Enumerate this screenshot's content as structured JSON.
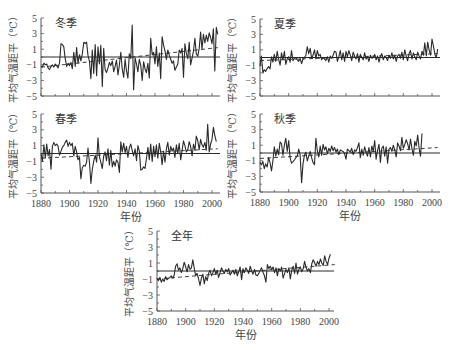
{
  "figure": {
    "ylabel": "平均气温距平（℃）",
    "xlabel": "年份"
  },
  "chart_data": [
    {
      "type": "line",
      "title": "冬季",
      "xlabel": "",
      "ylabel": "平均气温距平（℃）",
      "xlim": [
        1880,
        2005
      ],
      "ylim": [
        -5,
        5
      ],
      "yticks": [
        5,
        3,
        1,
        -1,
        -3,
        -5
      ],
      "xticks": [],
      "grid": false,
      "baseline": 0,
      "trend": {
        "x": [
          1880,
          2004
        ],
        "y": [
          -1.3,
          1.2
        ],
        "style": "dashed"
      },
      "series": [
        {
          "name": "冬季",
          "x_start": 1880,
          "values": [
            -1.2,
            -1.3,
            -0.8,
            -1.0,
            -0.9,
            -1.4,
            -1.6,
            -1.2,
            -1.0,
            -1.3,
            -0.9,
            -1.1,
            -1.4,
            -0.8,
            1.7,
            1.6,
            1.3,
            -0.2,
            -1.2,
            -0.8,
            -1.1,
            -0.7,
            -1.5,
            0.6,
            -1.2,
            1.2,
            -0.8,
            0.3,
            -0.5,
            0.4,
            1.9,
            1.7,
            1.9,
            0.2,
            -0.6,
            -2.8,
            0.9,
            -2.1,
            1.6,
            -2.4,
            1.3,
            -0.9,
            1.5,
            -3.8,
            1.1,
            -1.6,
            -2.0,
            -1.4,
            -0.7,
            -1.1,
            -0.5,
            -1.9,
            -1.2,
            -0.4,
            -2.3,
            -1.0,
            0.6,
            -1.5,
            -2.6,
            -0.3,
            -1.8,
            -2.7,
            0.4,
            -0.2,
            4.1,
            -4.2,
            -0.1,
            -0.9,
            -1.9,
            -0.3,
            -1.1,
            -3.0,
            -0.6,
            -1.5,
            -2.0,
            -0.8,
            -2.7,
            2.4,
            0.3,
            0.6,
            -0.9,
            1.3,
            -1.2,
            0.5,
            -2.8,
            2.6,
            1.5,
            0.8,
            -0.3,
            0.9,
            0.2,
            -0.3,
            -0.8,
            -0.5,
            -1.7,
            -1.3,
            -0.9,
            0.9,
            0.5,
            1.1,
            -2.6,
            1.7,
            0.5,
            -0.2,
            1.9,
            -1.0,
            -0.1,
            0.8,
            2.4,
            0.4,
            0.1,
            1.1,
            3.2,
            1.0,
            2.9,
            1.8,
            2.8,
            2.0,
            3.1,
            2.5,
            1.7,
            3.6,
            -1.8,
            3.8,
            2.9
          ]
        }
      ]
    },
    {
      "type": "line",
      "title": "夏季",
      "xlabel": "",
      "ylabel": "平均气温距平（℃）",
      "xlim": [
        1880,
        2005
      ],
      "ylim": [
        -5,
        5
      ],
      "yticks": [
        5,
        3,
        1,
        -1,
        -3,
        -5
      ],
      "xticks": [],
      "grid": false,
      "baseline": 0,
      "trend": {
        "x": [
          1880,
          2004
        ],
        "y": [
          -0.4,
          0.5
        ],
        "style": "dashed"
      },
      "series": [
        {
          "name": "夏季",
          "x_start": 1880,
          "values": [
            -1.1,
            0.2,
            -2.0,
            -1.6,
            -1.8,
            -1.4,
            -1.2,
            -1.5,
            0.1,
            -0.6,
            0.4,
            -0.5,
            0.8,
            -0.2,
            -1.0,
            0.6,
            -0.3,
            0.8,
            -0.9,
            -0.2,
            0.1,
            -0.6,
            0.9,
            -0.4,
            -0.1,
            0.0,
            -0.3,
            -0.5,
            -0.1,
            -0.8,
            -0.2,
            0.0,
            0.3,
            1.4,
            0.5,
            1.2,
            -0.1,
            0.3,
            1.0,
            -0.2,
            0.9,
            0.2,
            0.4,
            -0.3,
            0.0,
            -0.2,
            -0.4,
            0.1,
            -0.6,
            0.2,
            -0.1,
            0.3,
            0.8,
            0.7,
            -0.5,
            0.1,
            0.9,
            -0.3,
            0.6,
            -0.5,
            0.8,
            0.1,
            0.9,
            0.3,
            -0.4,
            0.7,
            0.2,
            -0.2,
            0.5,
            -0.6,
            0.4,
            0.0,
            -0.3,
            0.6,
            -0.2,
            0.1,
            -0.5,
            0.3,
            -0.1,
            0.0,
            0.4,
            -0.3,
            0.2,
            -0.6,
            0.1,
            0.5,
            -0.3,
            0.2,
            0.0,
            -0.4,
            0.3,
            -0.1,
            0.6,
            -0.2,
            0.3,
            -0.5,
            0.2,
            0.4,
            -0.1,
            0.7,
            -0.3,
            1.0,
            0.2,
            -0.4,
            0.5,
            0.9,
            -0.2,
            0.6,
            0.1,
            -0.3,
            0.7,
            0.2,
            -0.2,
            0.8,
            0.3,
            1.9,
            0.2,
            2.0,
            1.0,
            0.3,
            2.4,
            1.5,
            0.4,
            0.0,
            1.1
          ]
        }
      ]
    },
    {
      "type": "line",
      "title": "春季",
      "xlabel": "",
      "ylabel": "平均气温距平（℃）",
      "xlim": [
        1880,
        2005
      ],
      "ylim": [
        -5,
        5
      ],
      "yticks": [
        5,
        3,
        1,
        -1,
        -3,
        -5
      ],
      "xticks": [
        "1880",
        "1900",
        "1920",
        "1940",
        "1960",
        "1980",
        "2000"
      ],
      "grid": false,
      "baseline": 0,
      "trend": {
        "x": [
          1880,
          2004
        ],
        "y": [
          -0.6,
          0.6
        ],
        "style": "dashed"
      },
      "series": [
        {
          "name": "春季",
          "x_start": 1880,
          "values": [
            0.0,
            -1.0,
            1.1,
            -0.6,
            1.2,
            -0.3,
            0.5,
            -2.0,
            0.9,
            1.4,
            1.0,
            1.2,
            0.9,
            -0.2,
            0.3,
            0.8,
            1.0,
            1.4,
            1.7,
            0.9,
            1.4,
            1.0,
            1.3,
            -0.3,
            0.9,
            0.2,
            -0.8,
            -0.5,
            -3.2,
            -1.8,
            -1.5,
            -1.6,
            -1.1,
            0.7,
            -1.2,
            -3.8,
            -2.0,
            -1.0,
            -0.2,
            -1.1,
            2.0,
            -0.4,
            -1.1,
            -1.9,
            -0.3,
            0.2,
            -0.9,
            0.6,
            -1.5,
            0.4,
            -1.7,
            -1.0,
            -1.6,
            -0.8,
            -1.1,
            -2.4,
            1.5,
            0.2,
            1.3,
            0.1,
            0.9,
            -0.5,
            0.7,
            1.2,
            0.4,
            -0.3,
            0.6,
            -0.9,
            1.0,
            0.3,
            -2.1,
            -2.0,
            -1.7,
            -1.9,
            -0.7,
            0.8,
            -0.8,
            1.2,
            -1.0,
            0.9,
            -0.4,
            1.1,
            -0.6,
            1.3,
            0.2,
            -1.4,
            0.3,
            -1.1,
            0.6,
            1.4,
            -0.2,
            0.9,
            0.3,
            0.7,
            -0.5,
            1.1,
            0.0,
            1.3,
            -0.8,
            0.4,
            1.6,
            1.0,
            0.2,
            0.5,
            1.5,
            0.9,
            -0.3,
            1.2,
            0.4,
            2.2,
            1.6,
            0.5,
            1.8,
            1.1,
            0.8,
            1.4,
            0.4,
            3.7,
            0.2,
            1.2,
            1.8,
            3.3,
            2.3,
            1.5
          ]
        }
      ]
    },
    {
      "type": "line",
      "title": "秋季",
      "xlabel": "年份",
      "ylabel": "平均气温距平（℃）",
      "xlim": [
        1880,
        2005
      ],
      "ylim": [
        -5,
        5
      ],
      "yticks": [
        5,
        3,
        1,
        -1,
        -3,
        -5
      ],
      "xticks": [
        "1880",
        "1900",
        "1920",
        "1940",
        "1960",
        "1980",
        "2000"
      ],
      "grid": false,
      "baseline": 0,
      "trend": {
        "x": [
          1880,
          2004
        ],
        "y": [
          -0.7,
          0.7
        ],
        "style": "dashed"
      },
      "series": [
        {
          "name": "秋季",
          "x_start": 1880,
          "values": [
            -1.2,
            -1.5,
            -1.1,
            -2.0,
            -1.4,
            -1.8,
            -0.6,
            -1.2,
            -2.3,
            -1.0,
            0.8,
            -0.4,
            0.5,
            -0.2,
            1.4,
            1.2,
            -0.3,
            1.0,
            1.9,
            0.2,
            1.6,
            -0.6,
            -1.3,
            -1.1,
            -0.9,
            -0.6,
            -0.4,
            0.5,
            -0.2,
            -3.8,
            -1.4,
            -0.3,
            0.1,
            -1.0,
            -0.4,
            0.2,
            -0.6,
            -1.2,
            -1.5,
            1.9,
            0.3,
            -0.5,
            0.9,
            -0.3,
            1.1,
            0.4,
            0.8,
            -0.1,
            0.6,
            0.2,
            0.9,
            0.3,
            0.7,
            0.1,
            0.5,
            -0.2,
            0.4,
            0.3,
            0.2,
            -0.1,
            -0.8,
            0.5,
            0.3,
            0.1,
            0.6,
            -0.2,
            0.4,
            0.2,
            0.7,
            1.3,
            -0.6,
            0.5,
            -0.3,
            0.8,
            0.1,
            -0.4,
            0.7,
            -0.5,
            0.9,
            0.2,
            1.6,
            -0.8,
            0.3,
            1.1,
            -1.2,
            0.6,
            0.9,
            -0.4,
            0.8,
            -1.3,
            0.5,
            0.7,
            0.2,
            1.0,
            0.4,
            -0.5,
            1.3,
            0.9,
            0.3,
            2.0,
            0.6,
            1.1,
            1.7,
            1.2,
            0.4,
            1.8,
            0.6,
            -0.3,
            1.5,
            0.9,
            2.3,
            0.6,
            -0.4,
            2.5
          ]
        }
      ]
    },
    {
      "type": "line",
      "title": "全年",
      "xlabel": "年份",
      "ylabel": "平均气温距平（℃）",
      "xlim": [
        1880,
        2005
      ],
      "ylim": [
        -5,
        5
      ],
      "yticks": [
        5,
        3,
        1,
        -1,
        -3,
        -5
      ],
      "xticks": [
        "1880",
        "1900",
        "1920",
        "1940",
        "1960",
        "1980",
        "2000"
      ],
      "grid": false,
      "baseline": 0,
      "trend": {
        "x": [
          1880,
          2004
        ],
        "y": [
          -1.0,
          0.8
        ],
        "style": "dashed"
      },
      "series": [
        {
          "name": "全年",
          "x_start": 1880,
          "values": [
            -0.9,
            -1.2,
            -0.8,
            -1.4,
            -1.0,
            -1.3,
            -0.7,
            -1.1,
            -0.9,
            -0.8,
            -0.6,
            -0.9,
            -0.5,
            0.6,
            0.9,
            0.1,
            0.4,
            -0.2,
            0.3,
            1.1,
            0.5,
            -0.1,
            0.8,
            0.2,
            0.4,
            1.4,
            0.3,
            -0.6,
            -0.3,
            -1.0,
            -1.8,
            -0.9,
            -0.4,
            -1.6,
            -0.7,
            -1.2,
            -0.3,
            0.1,
            -0.6,
            -0.2,
            0.3,
            -0.4,
            0.1,
            -0.8,
            -0.2,
            0.4,
            0.0,
            -0.3,
            0.2,
            -0.1,
            0.3,
            -0.5,
            -0.2,
            0.1,
            -0.4,
            0.2,
            -0.6,
            -0.1,
            0.5,
            -1.1,
            0.3,
            -0.2,
            0.4,
            0.1,
            -0.3,
            0.6,
            0.0,
            -0.4,
            0.2,
            -0.5,
            -0.6,
            -0.3,
            0.1,
            0.4,
            -0.2,
            -0.6,
            -1.4,
            0.8,
            0.3,
            0.6,
            0.2,
            0.5,
            -0.2,
            0.4,
            -0.6,
            0.3,
            0.0,
            0.5,
            -0.9,
            -0.3,
            0.2,
            -0.2,
            0.4,
            -1.0,
            0.1,
            0.6,
            -0.3,
            1.0,
            -0.4,
            0.2,
            0.5,
            -0.1,
            0.3,
            1.2,
            0.4,
            0.0,
            0.3,
            -0.2,
            0.9,
            1.4,
            1.0,
            0.6,
            1.2,
            0.8,
            1.5,
            1.0,
            0.7,
            1.9,
            1.2,
            0.8,
            1.6,
            2.1
          ]
        }
      ]
    }
  ],
  "panels": [
    {
      "title": "冬季"
    },
    {
      "title": "夏季"
    },
    {
      "title": "春季"
    },
    {
      "title": "秋季"
    },
    {
      "title": "全年"
    }
  ],
  "colors": {
    "line": "#2a2a2a",
    "axis": "#555555",
    "text": "#444444"
  }
}
